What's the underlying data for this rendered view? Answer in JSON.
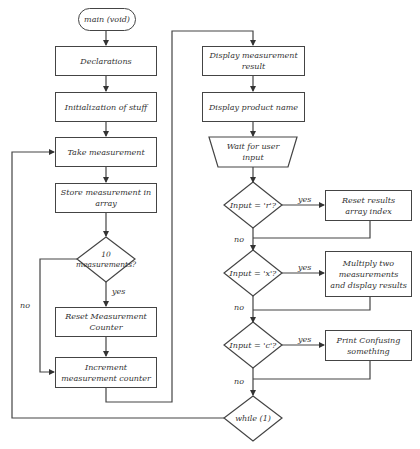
{
  "diagram": {
    "type": "flowchart",
    "stroke_color": "#444444",
    "text_color": "#333333",
    "nodes": {
      "start": {
        "label": "main (void)",
        "shape": "terminator"
      },
      "declarations": {
        "label": "Declarations",
        "shape": "process"
      },
      "init": {
        "label": "Initialization of stuff",
        "shape": "process"
      },
      "take_measurement": {
        "label": "Take measurement",
        "shape": "process"
      },
      "store_measurement": {
        "label": "Store measurement in array",
        "shape": "process"
      },
      "check_10": {
        "label": "10 measurements?",
        "shape": "decision"
      },
      "reset_counter": {
        "label": "Reset Measurement Counter",
        "shape": "process"
      },
      "increment_counter": {
        "label": "Increment measurement counter",
        "shape": "process"
      },
      "display_result": {
        "label": "Display measurement result",
        "shape": "process"
      },
      "display_product": {
        "label": "Display product name",
        "shape": "process"
      },
      "wait_input": {
        "label": "Wait for user input",
        "shape": "manual-input"
      },
      "check_r": {
        "label": "Input = 'r'?",
        "shape": "decision"
      },
      "reset_index": {
        "label": "Reset results array index",
        "shape": "process"
      },
      "check_x": {
        "label": "Input = 'x'?",
        "shape": "decision"
      },
      "multiply": {
        "label": "Multiply two measurements and display results",
        "shape": "process"
      },
      "check_c": {
        "label": "Input = 'c'?",
        "shape": "decision"
      },
      "print_confusing": {
        "label": "Print Confusing something",
        "shape": "process"
      },
      "while_loop": {
        "label": "while (1)",
        "shape": "decision"
      }
    },
    "edge_labels": {
      "check_10_yes": "yes",
      "check_10_no": "no",
      "check_r_yes": "yes",
      "check_r_no": "no",
      "check_x_yes": "yes",
      "check_x_no": "no",
      "check_c_yes": "yes",
      "check_c_no": "no",
      "while_loop_back": "no"
    },
    "edges": [
      {
        "from": "start",
        "to": "declarations"
      },
      {
        "from": "declarations",
        "to": "init"
      },
      {
        "from": "init",
        "to": "take_measurement"
      },
      {
        "from": "take_measurement",
        "to": "store_measurement"
      },
      {
        "from": "store_measurement",
        "to": "check_10"
      },
      {
        "from": "check_10",
        "to": "reset_counter",
        "label": "yes"
      },
      {
        "from": "check_10",
        "to": "increment_counter",
        "label": "no"
      },
      {
        "from": "reset_counter",
        "to": "increment_counter"
      },
      {
        "from": "increment_counter",
        "to": "display_result"
      },
      {
        "from": "display_result",
        "to": "display_product"
      },
      {
        "from": "display_product",
        "to": "wait_input"
      },
      {
        "from": "wait_input",
        "to": "check_r"
      },
      {
        "from": "check_r",
        "to": "reset_index",
        "label": "yes"
      },
      {
        "from": "check_r",
        "to": "check_x",
        "label": "no"
      },
      {
        "from": "reset_index",
        "to": "check_x"
      },
      {
        "from": "check_x",
        "to": "multiply",
        "label": "yes"
      },
      {
        "from": "check_x",
        "to": "check_c",
        "label": "no"
      },
      {
        "from": "multiply",
        "to": "check_c"
      },
      {
        "from": "check_c",
        "to": "print_confusing",
        "label": "yes"
      },
      {
        "from": "check_c",
        "to": "while_loop",
        "label": "no"
      },
      {
        "from": "print_confusing",
        "to": "while_loop"
      },
      {
        "from": "while_loop",
        "to": "take_measurement"
      }
    ]
  }
}
